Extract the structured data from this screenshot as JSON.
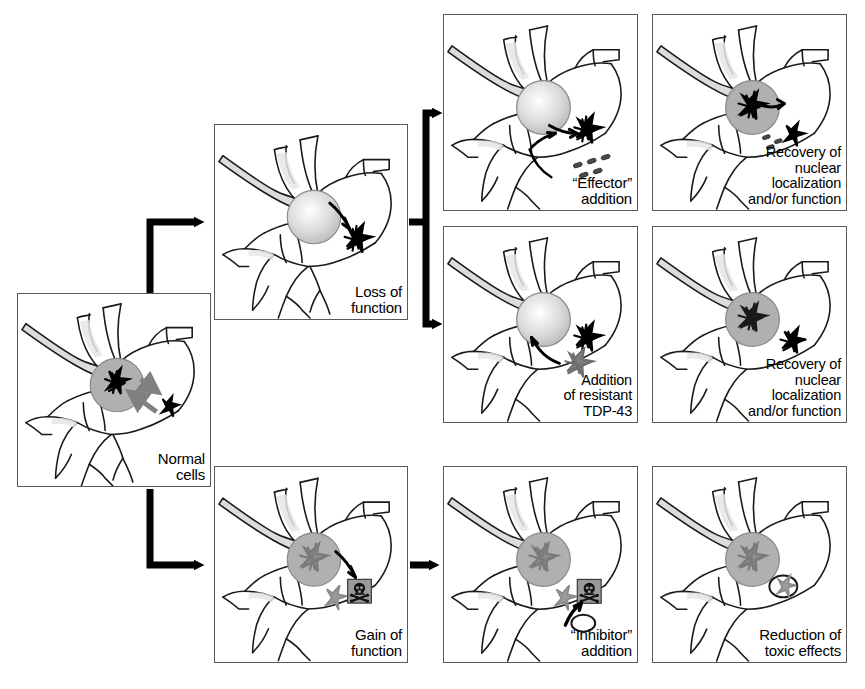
{
  "figure": {
    "type": "schematic-flowchart",
    "background_color": "#ffffff",
    "panel_border_color": "#5a5a5a",
    "ink_color": "#000000",
    "nucleus_gray": "#b5b5b5",
    "cytoplasm_gray": "#d9d9d9"
  },
  "panels": [
    {
      "id": "normal-cells",
      "label": "Normal\ncells",
      "row": "middle-left",
      "nucleus_state": "dark-aggregate-in-nucleus",
      "has_skull_icon": false,
      "shuttling_arrows": "bidirectional-gray"
    },
    {
      "id": "loss-of-function",
      "label": "Loss of\nfunction",
      "row": "top-branch",
      "nucleus_state": "empty-pale-nucleus",
      "has_skull_icon": false,
      "shuttling_arrows": "outward-black"
    },
    {
      "id": "effector-addition",
      "label": "“Effector”\naddition",
      "row": "top",
      "nucleus_state": "empty-pale-nucleus",
      "has_skull_icon": false,
      "shuttling_arrows": "outward-black-with-effector-particles"
    },
    {
      "id": "recovery-top",
      "label": "Recovery of\nnuclear\nlocalization\nand/or function",
      "row": "top",
      "nucleus_state": "aggregate-returned-to-nucleus",
      "has_skull_icon": false,
      "shuttling_arrows": "inward-black"
    },
    {
      "id": "resistant-tdp43-addition",
      "label": "Addition\nof resistant\nTDP-43",
      "row": "middle",
      "nucleus_state": "empty-pale-nucleus",
      "has_skull_icon": false,
      "shuttling_arrows": "inward-black"
    },
    {
      "id": "recovery-middle",
      "label": "Recovery of\nnuclear\nlocalization\nand/or function",
      "row": "middle",
      "nucleus_state": "aggregate-returned-to-nucleus",
      "has_skull_icon": false,
      "shuttling_arrows": "none"
    },
    {
      "id": "gain-of-function",
      "label": "Gain of\nfunction",
      "row": "bottom",
      "nucleus_state": "gray-aggregate-in-nucleus",
      "has_skull_icon": true,
      "shuttling_arrows": "outward-black"
    },
    {
      "id": "inhibitor-addition",
      "label": "“Inhibitor”\naddition",
      "row": "bottom",
      "nucleus_state": "gray-aggregate-in-nucleus",
      "has_skull_icon": true,
      "shuttling_arrows": "inhibitor-arrow-with-particle"
    },
    {
      "id": "reduction-toxic-effects",
      "label": "Reduction of\ntoxic effects",
      "row": "bottom",
      "nucleus_state": "gray-aggregate-in-nucleus",
      "has_skull_icon": false,
      "shuttling_arrows": "neutralized-aggregate-circled"
    }
  ],
  "connectors": [
    {
      "id": "normal-to-loss",
      "from": "normal-cells",
      "to": "loss-of-function",
      "style": "elbow-up"
    },
    {
      "id": "normal-to-gain",
      "from": "normal-cells",
      "to": "gain-of-function",
      "style": "elbow-down"
    },
    {
      "id": "loss-to-effector",
      "from": "loss-of-function",
      "to": "effector-addition",
      "style": "split-up"
    },
    {
      "id": "loss-to-resistant",
      "from": "loss-of-function",
      "to": "resistant-tdp43-addition",
      "style": "split-down"
    },
    {
      "id": "gain-to-inhibitor",
      "from": "gain-of-function",
      "to": "inhibitor-addition",
      "style": "straight-right"
    }
  ]
}
